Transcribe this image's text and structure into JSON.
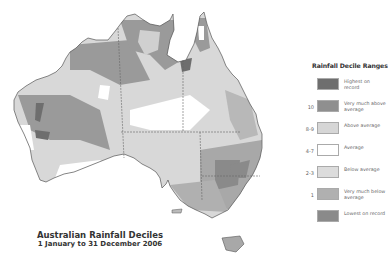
{
  "title": {
    "main": "Australian Rainfall Deciles",
    "subtitle": "1 January to 31 December 2006"
  },
  "legend": {
    "title": "Rainfall Decile Ranges",
    "items": [
      {
        "range": "",
        "label": "Highest on record",
        "color": "#6e6e6e"
      },
      {
        "range": "10",
        "label": "Very much above average",
        "color": "#8f8f8f"
      },
      {
        "range": "8-9",
        "label": "Above average",
        "color": "#d6d6d6"
      },
      {
        "range": "4-7",
        "label": "Average",
        "color": "#ffffff"
      },
      {
        "range": "2-3",
        "label": "Below average",
        "color": "#dcdcdc"
      },
      {
        "range": "1",
        "label": "Very much below average",
        "color": "#b0b0b0"
      },
      {
        "range": "",
        "label": "Lowest on record",
        "color": "#8a8a8a"
      }
    ]
  },
  "map": {
    "region": "Australia",
    "colors": {
      "land_base": "#d8d8d8",
      "very_much_above": "#9a9a9a",
      "highest": "#6e6e6e",
      "average": "#ffffff",
      "below": "#c4c4c4",
      "very_much_below": "#a8a8a8",
      "border": "#555555",
      "state_line": "#666666"
    }
  }
}
